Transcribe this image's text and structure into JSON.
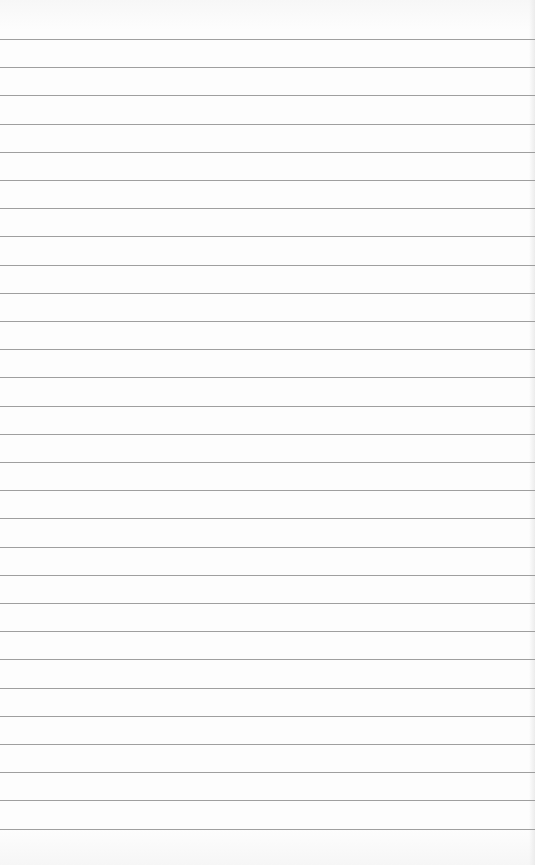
{
  "page": {
    "type": "lined-paper",
    "background_color": "#fdfdfd",
    "line_color": "#8e8e8e",
    "line_count": 29,
    "first_line_y": 39,
    "line_spacing": 28.2
  }
}
